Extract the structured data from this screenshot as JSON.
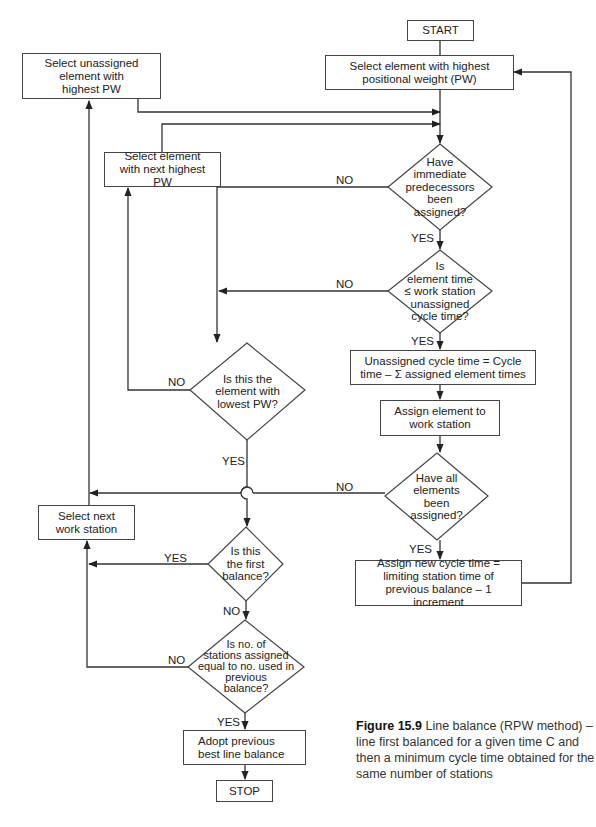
{
  "flowchart": {
    "start": "START",
    "stop": "STOP",
    "boxes": {
      "select_highest_pw": "Select element with highest positional weight (PW)",
      "select_unassigned_highest": "Select unassigned element with highest PW",
      "select_next_highest": "Select element with next highest PW",
      "unassigned_cycle_time": "Unassigned cycle time = Cycle time – Σ assigned element times",
      "assign_element": "Assign element to work station",
      "select_next_station": "Select next work station",
      "assign_new_cycle_time": "Assign new cycle time = limiting station time of previous balance – 1 increment",
      "adopt_previous": "Adopt previous best line balance"
    },
    "decisions": {
      "predecessors_assigned": "Have\nimmediate\npredecessors\nbeen\nassigned?",
      "element_time_fits": "Is\nelement time\n≤ work station\nunassigned\ncycle time?",
      "lowest_pw": "Is this the\nelement with\nlowest PW?",
      "all_assigned": "Have all\nelements\nbeen\nassigned?",
      "first_balance": "Is this\nthe first\nbalance?",
      "stations_equal": "Is no. of\nstations assigned\nequal to no. used in\nprevious\nbalance?"
    },
    "labels": {
      "yes": "YES",
      "no": "NO"
    }
  },
  "caption": {
    "figure_number": "Figure 15.9",
    "text": "Line balance (RPW method) – line first balanced for a given time C and then a minimum cycle time obtained for the same number of stations"
  },
  "colors": {
    "line": "#333333",
    "text": "#222222"
  }
}
